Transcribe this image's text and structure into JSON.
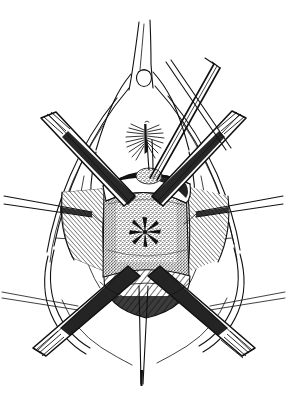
{
  "figure": {
    "kind": "line-art-illustration",
    "medium": "pen-and-ink stipple and hatch drawing",
    "subject": "perineal surgical exposure with retractors and forceps",
    "background_color": "#ffffff",
    "ink_color": "#111111",
    "width_px": 287,
    "height_px": 399,
    "has_text_labels": false,
    "has_caption": false,
    "has_leader_lines": false
  },
  "anatomy": {
    "apex_structure": {
      "name": "upper-apex-fold",
      "description": "narrow vertical fold converging to a point at the top of the field"
    },
    "meatus": {
      "name": "small-round-orifice",
      "description": "small open circle just below the apex",
      "shape": "circle"
    },
    "tuft": {
      "name": "hatched-tuft",
      "description": "small fan of fine hatch strokes with a dark vertical core, mid-field"
    },
    "central_mass": {
      "name": "stippled-dome",
      "description": "large rectangular stippled mass occupying the center of the exposure",
      "texture": "dense stipple"
    },
    "os": {
      "name": "stellate-opening",
      "description": "radial star-shaped slit at the center of the stippled mass",
      "ray_count": 7
    },
    "upper_shelf": {
      "name": "cross-hatched-shelf",
      "description": "curved cross-hatched band draped over the top of the stippled mass"
    },
    "lower_shelf": {
      "name": "lower-hatched-fold",
      "description": "hatched crescent fold below the stippled mass"
    },
    "side_walls": {
      "name": "lateral-hatched-walls",
      "description": "two triangular hatched wall surfaces flanking the central mass"
    },
    "outer_contours": {
      "name": "body-contour-lines",
      "description": "long sweeping outline curves framing the field on both sides"
    }
  },
  "instruments": [
    {
      "id": "retractor-upper-left",
      "name": "upper-left-retractor",
      "type": "blade-retractor",
      "orientation": "diagonal from upper-left toward center",
      "tip_style": "striped flat blade"
    },
    {
      "id": "retractor-upper-right",
      "name": "upper-right-retractor",
      "type": "blade-retractor",
      "orientation": "diagonal from upper-right toward center",
      "tip_style": "striped flat blade"
    },
    {
      "id": "forceps-upper-right-crossing",
      "name": "upper-right-crossing-forceps",
      "type": "long-forceps",
      "orientation": "steep diagonal crossing the upper field",
      "tip_style": "tapered shaft pair"
    },
    {
      "id": "retractor-lower-left",
      "name": "lower-left-retractor",
      "type": "blade-retractor",
      "orientation": "diagonal from center down to lower-left",
      "tip_style": "striped flat blade"
    },
    {
      "id": "retractor-lower-right",
      "name": "lower-right-retractor",
      "type": "blade-retractor",
      "orientation": "diagonal from center down to lower-right",
      "tip_style": "striped flat blade"
    },
    {
      "id": "probe-center-lower",
      "name": "central-descending-probe",
      "type": "slender-probe",
      "orientation": "near-vertical descending from the lower shelf",
      "tip_style": "fine taper"
    },
    {
      "id": "traction-left",
      "name": "left-horizontal-traction-line",
      "type": "traction-suture",
      "orientation": "horizontal to the left margin",
      "tip_style": "thin paired line"
    },
    {
      "id": "traction-right",
      "name": "right-horizontal-traction-line",
      "type": "traction-suture",
      "orientation": "horizontal to the right margin",
      "tip_style": "thin paired line"
    }
  ]
}
